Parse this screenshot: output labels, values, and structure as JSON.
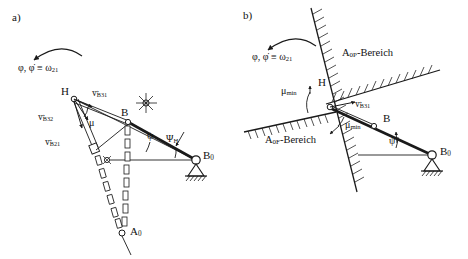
{
  "figure": {
    "type": "mechanism-kinematics-diagram",
    "panels": [
      {
        "id": "a)",
        "rotation_note": {
          "symbol": "φ, φ̇ ≡ ω",
          "sub": "21"
        },
        "points": [
          {
            "name": "H",
            "label": "H"
          },
          {
            "name": "B",
            "label": "B"
          },
          {
            "name": "B0",
            "label": "B",
            "sub": "0"
          },
          {
            "name": "A0",
            "label": "A",
            "sub": "0"
          }
        ],
        "vectors": [
          {
            "name": "v_B31",
            "base": "v",
            "sub": "B31"
          },
          {
            "name": "v_B32",
            "base": "v",
            "sub": "B32"
          },
          {
            "name": "v_B21",
            "base": "v",
            "sub": "B21"
          }
        ],
        "angles": [
          {
            "name": "mu",
            "label": "μ"
          },
          {
            "name": "psi",
            "label": "ψ"
          },
          {
            "name": "psiH",
            "label": "Ψ",
            "sub": "H"
          }
        ]
      },
      {
        "id": "b)",
        "rotation_note": {
          "symbol": "φ, φ̇ ≡ ω",
          "sub": "21"
        },
        "points": [
          {
            "name": "H",
            "label": "H"
          },
          {
            "name": "B",
            "label": "B"
          },
          {
            "name": "B0",
            "label": "B",
            "sub": "0"
          }
        ],
        "vectors": [
          {
            "name": "v_B31",
            "base": "v",
            "sub": "B31"
          }
        ],
        "angles": [
          {
            "name": "mu_min_upper",
            "label": "μ",
            "sub": "min"
          },
          {
            "name": "mu_min_lower",
            "label": "μ",
            "sub": "min"
          },
          {
            "name": "psi",
            "label": "ψ"
          }
        ],
        "regions": [
          {
            "name": "A0P-Bereich",
            "base": "A",
            "sub": "0P",
            "suffix": "-Bereich"
          },
          {
            "name": "A0F-Bereich",
            "base": "A",
            "sub": "0F",
            "suffix": "-Bereich"
          }
        ]
      }
    ],
    "colors": {
      "stroke": "#1a1a1a",
      "ground_hatch": "#1a1a1a",
      "background": "#ffffff"
    }
  }
}
